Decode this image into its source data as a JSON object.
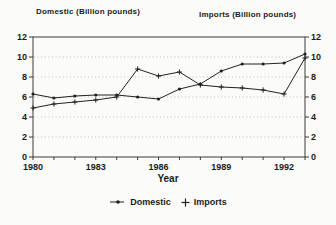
{
  "chart_data": {
    "type": "line",
    "title": "",
    "x": [
      1980,
      1981,
      1982,
      1983,
      1984,
      1985,
      1986,
      1987,
      1988,
      1989,
      1990,
      1991,
      1992,
      1993
    ],
    "series": [
      {
        "name": "Domestic",
        "marker": "dot",
        "values": [
          6.3,
          5.9,
          6.1,
          6.2,
          6.2,
          6.0,
          5.8,
          6.8,
          7.3,
          8.6,
          9.3,
          9.3,
          9.4,
          10.3
        ]
      },
      {
        "name": "Imports",
        "marker": "plus",
        "values": [
          4.9,
          5.3,
          5.5,
          5.7,
          6.0,
          8.8,
          8.1,
          8.5,
          7.2,
          7.0,
          6.9,
          6.7,
          6.3,
          9.9
        ]
      }
    ],
    "xlabel": "Year",
    "ylabel_left": "Domestic (Billion pounds)",
    "ylabel_right": "Imports (Billion pounds)",
    "ylim": [
      0,
      12
    ],
    "yticks": [
      0,
      2,
      4,
      6,
      8,
      10,
      12
    ],
    "xticks_labeled": [
      1980,
      1983,
      1986,
      1989,
      1992
    ],
    "grid": "horizontal dotted at 2,4,6,8,10",
    "legend_position": "bottom"
  },
  "colors": {
    "line": "#222222",
    "axis": "#3a3a3a",
    "grid": "#b9b9b9",
    "text": "#1b1b1b",
    "background": "#fbfbf9"
  }
}
